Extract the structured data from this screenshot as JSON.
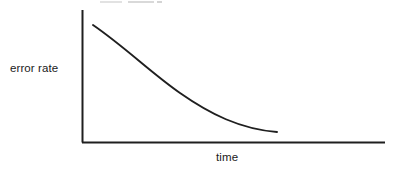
{
  "figure": {
    "background_color": "#ffffff",
    "line_color": "#1f1f1f",
    "text_color": "#1a1a1a",
    "width": 394,
    "height": 173
  },
  "labels": {
    "y_axis": "error rate",
    "x_axis": "time"
  },
  "artifacts": {
    "scan_smudge_present": true
  },
  "chart_data": {
    "type": "line",
    "title": "",
    "subtitle": "",
    "xlabel": "time",
    "ylabel": "error rate",
    "legend": [],
    "legend_position": "none",
    "grid": false,
    "axis_ticks": false,
    "tick_labels_x": [],
    "tick_labels_y": [],
    "xlim": [
      0,
      1
    ],
    "ylim": [
      0,
      1
    ],
    "series": [
      {
        "name": "error rate",
        "shape": "exponential decay",
        "x": [
          0.036,
          0.1,
          0.18,
          0.26,
          0.34,
          0.43,
          0.52,
          0.61,
          0.7,
          0.79,
          0.88,
          0.96
        ],
        "y": [
          0.886,
          0.796,
          0.69,
          0.592,
          0.503,
          0.411,
          0.33,
          0.258,
          0.196,
          0.143,
          0.102,
          0.077
        ],
        "pixel_points": [
          [
            93,
            25
          ],
          [
            113,
            37
          ],
          [
            137,
            51
          ],
          [
            160,
            64
          ],
          [
            182,
            76
          ],
          [
            207,
            88
          ],
          [
            232,
            99
          ],
          [
            257,
            109
          ],
          [
            282,
            117
          ],
          [
            307,
            124
          ],
          [
            332,
            130
          ],
          [
            355,
            133
          ]
        ]
      }
    ],
    "axes_pixels": {
      "y_axis_x": 82,
      "y_axis_top": 10,
      "origin": [
        82,
        142
      ],
      "x_axis_right": 385
    },
    "curve_pixels": {
      "start": [
        93,
        25
      ],
      "end": [
        277,
        132
      ],
      "control_points": [
        [
          150,
          72
        ],
        [
          180,
          93
        ],
        [
          240,
          120
        ]
      ]
    }
  }
}
